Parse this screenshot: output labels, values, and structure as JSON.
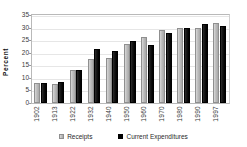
{
  "chart_data": {
    "type": "bar",
    "title": "",
    "xlabel": "",
    "ylabel": "Percent",
    "ylim": [
      0,
      35
    ],
    "yticks": [
      0,
      5,
      10,
      15,
      20,
      25,
      30,
      35
    ],
    "grid": true,
    "legend_position": "bottom",
    "categories": [
      "1902",
      "1913",
      "1922",
      "1932",
      "1940",
      "1950",
      "1960",
      "1970",
      "1980",
      "1990",
      "1997"
    ],
    "series": [
      {
        "name": "Receipts",
        "color": "#bdbdbd",
        "values": [
          8.0,
          7.5,
          13.0,
          17.7,
          18.0,
          23.5,
          26.4,
          29.0,
          30.0,
          30.0,
          32.0
        ]
      },
      {
        "name": "Current  Expenditures",
        "color": "#000000",
        "values": [
          8.0,
          8.3,
          13.0,
          21.5,
          20.7,
          24.6,
          23.0,
          28.0,
          30.0,
          31.5,
          30.5
        ]
      }
    ]
  },
  "legend": {
    "items": [
      {
        "label": "Receipts",
        "swatch": "receipts-swatch-icon"
      },
      {
        "label": "Current  Expenditures",
        "swatch": "expenditures-swatch-icon"
      }
    ]
  },
  "axis": {
    "y_title": "Percent"
  }
}
